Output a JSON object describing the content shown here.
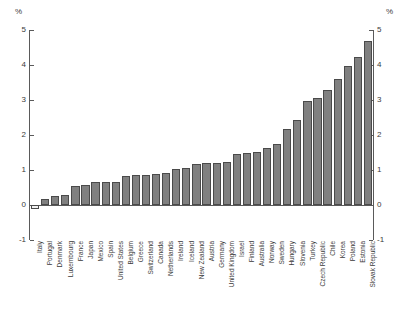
{
  "chart_data": {
    "type": "bar",
    "title": "",
    "subtitle": "",
    "xlabel": "",
    "ylabel": "%",
    "ylabel_right": "%",
    "ylim": [
      -1,
      5
    ],
    "yticks": [
      -1,
      0,
      1,
      2,
      3,
      4,
      5
    ],
    "ytick_labels": [
      "-1",
      "0",
      "1",
      "2",
      "3",
      "4",
      "5"
    ],
    "grid": false,
    "legend": null,
    "bar_color": "#808080",
    "bar_edge_color": "#4a4a4a",
    "negative_bar_color": "#f2f2f2",
    "axis_color": "#5a5a5a",
    "categories": [
      "Italy",
      "Portugal",
      "Denmark",
      "Luxembourg",
      "France",
      "Japan",
      "Mexico",
      "Spain",
      "United States",
      "Belgium",
      "Greece",
      "Switzerland",
      "Canada",
      "Netherlands",
      "Ireland",
      "Iceland",
      "New Zealand",
      "Austria",
      "Germany",
      "United Kingdom",
      "Israel",
      "Finland",
      "Australia",
      "Norway",
      "Sweden",
      "Hungary",
      "Slovenia",
      "Turkey",
      "Czech Republic",
      "Chile",
      "Korea",
      "Poland",
      "Estonia",
      "Slovak Republic"
    ],
    "values": [
      -0.12,
      0.18,
      0.27,
      0.3,
      0.53,
      0.58,
      0.65,
      0.66,
      0.66,
      0.82,
      0.85,
      0.87,
      0.88,
      0.91,
      1.04,
      1.07,
      1.18,
      1.21,
      1.21,
      1.22,
      1.45,
      1.48,
      1.52,
      1.63,
      1.73,
      2.18,
      2.42,
      2.98,
      3.07,
      3.28,
      3.61,
      3.98,
      4.24,
      4.68
    ]
  }
}
